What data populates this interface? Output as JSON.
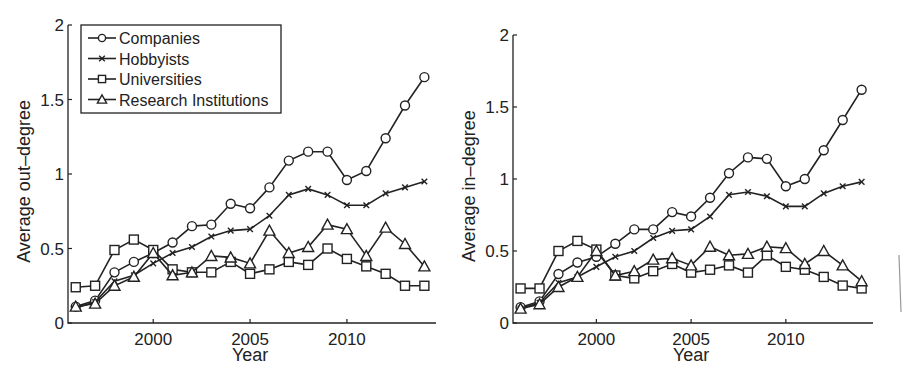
{
  "chart_data": [
    {
      "type": "line",
      "title": "",
      "xlabel": "Year",
      "ylabel": "Average out–degree",
      "xlim": [
        1995.6,
        2014.6
      ],
      "ylim": [
        0,
        2
      ],
      "xticks": [
        2000,
        2005,
        2010
      ],
      "yticks": [
        0,
        0.5,
        1,
        1.5,
        2
      ],
      "ytick_labels": [
        "0",
        "0.5",
        "1",
        "1.5",
        "2"
      ],
      "grid": false,
      "legend_position": "upper left",
      "x": [
        1996,
        1997,
        1998,
        1999,
        2000,
        2001,
        2002,
        2003,
        2004,
        2005,
        2006,
        2007,
        2008,
        2009,
        2010,
        2011,
        2012,
        2013,
        2014
      ],
      "series": [
        {
          "name": "Companies",
          "marker": "circle",
          "values": [
            0.11,
            0.15,
            0.34,
            0.41,
            0.47,
            0.54,
            0.65,
            0.66,
            0.8,
            0.77,
            0.91,
            1.09,
            1.15,
            1.15,
            0.96,
            1.02,
            1.24,
            1.46,
            1.65
          ]
        },
        {
          "name": "Hobbyists",
          "marker": "x",
          "values": [
            0.1,
            0.14,
            0.28,
            0.32,
            0.4,
            0.47,
            0.51,
            0.58,
            0.62,
            0.63,
            0.72,
            0.86,
            0.9,
            0.86,
            0.79,
            0.79,
            0.87,
            0.91,
            0.95
          ]
        },
        {
          "name": "Universities",
          "marker": "square",
          "values": [
            0.24,
            0.25,
            0.49,
            0.56,
            0.49,
            0.36,
            0.34,
            0.34,
            0.41,
            0.33,
            0.36,
            0.41,
            0.39,
            0.5,
            0.43,
            0.38,
            0.33,
            0.25,
            0.25
          ]
        },
        {
          "name": "Research Institutions",
          "marker": "triangle",
          "values": [
            0.11,
            0.13,
            0.25,
            0.31,
            0.47,
            0.32,
            0.34,
            0.45,
            0.44,
            0.4,
            0.62,
            0.47,
            0.51,
            0.66,
            0.63,
            0.45,
            0.64,
            0.53,
            0.38
          ]
        }
      ]
    },
    {
      "type": "line",
      "title": "",
      "xlabel": "Year",
      "ylabel": "Average in–degree",
      "xlim": [
        1995.6,
        2014.6
      ],
      "ylim": [
        0,
        2
      ],
      "xticks": [
        2000,
        2005,
        2010
      ],
      "yticks": [
        0,
        0.5,
        1,
        1.5,
        2
      ],
      "ytick_labels": [
        "0",
        "0.5",
        "1",
        "1.5",
        "2"
      ],
      "grid": false,
      "legend_position": "none",
      "x": [
        1996,
        1997,
        1998,
        1999,
        2000,
        2001,
        2002,
        2003,
        2004,
        2005,
        2006,
        2007,
        2008,
        2009,
        2010,
        2011,
        2012,
        2013,
        2014
      ],
      "series": [
        {
          "name": "Companies",
          "marker": "circle",
          "values": [
            0.11,
            0.15,
            0.34,
            0.42,
            0.46,
            0.55,
            0.65,
            0.65,
            0.77,
            0.74,
            0.87,
            1.04,
            1.15,
            1.14,
            0.95,
            1.0,
            1.2,
            1.41,
            1.62
          ]
        },
        {
          "name": "Hobbyists",
          "marker": "x",
          "values": [
            0.1,
            0.14,
            0.28,
            0.32,
            0.39,
            0.46,
            0.5,
            0.59,
            0.64,
            0.65,
            0.74,
            0.89,
            0.91,
            0.88,
            0.81,
            0.81,
            0.9,
            0.95,
            0.98
          ]
        },
        {
          "name": "Universities",
          "marker": "square",
          "values": [
            0.24,
            0.24,
            0.5,
            0.57,
            0.51,
            0.33,
            0.31,
            0.36,
            0.41,
            0.35,
            0.37,
            0.4,
            0.35,
            0.47,
            0.39,
            0.37,
            0.32,
            0.26,
            0.24
          ]
        },
        {
          "name": "Research Institutions",
          "marker": "triangle",
          "values": [
            0.1,
            0.13,
            0.25,
            0.32,
            0.5,
            0.33,
            0.36,
            0.44,
            0.45,
            0.4,
            0.53,
            0.47,
            0.48,
            0.53,
            0.52,
            0.41,
            0.5,
            0.4,
            0.29
          ]
        }
      ]
    }
  ],
  "layout": [
    {
      "plot": {
        "left": 68,
        "top": 25,
        "right": 436,
        "bottom": 323
      }
    },
    {
      "plot": {
        "left": 513,
        "top": 35,
        "right": 873,
        "bottom": 323
      }
    }
  ]
}
